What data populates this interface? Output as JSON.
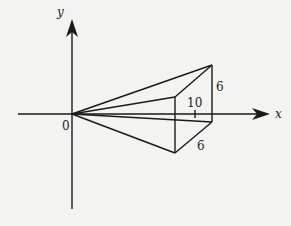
{
  "diagram": {
    "type": "3d-solid-on-axes",
    "axes": {
      "x_label": "x",
      "y_label": "y",
      "origin_label": "0"
    },
    "dimensions": {
      "length_label": "10",
      "height_label": "6",
      "width_label": "6"
    },
    "colors": {
      "background": "#f3f3f1",
      "line": "#1a1a1a"
    }
  }
}
